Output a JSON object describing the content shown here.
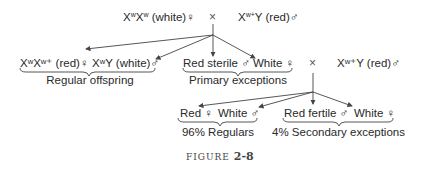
{
  "figure": {
    "label": "FIGURE",
    "number": "2-8"
  },
  "cross1": {
    "female": {
      "genotype_base": "X",
      "sup1": "w",
      "genotype_mid": "X",
      "sup2": "w",
      "phenotype": "(white)",
      "sex": "♀"
    },
    "cross_symbol": "×",
    "male": {
      "genotype_base": "X",
      "sup1": "w+",
      "genotype_end": "Y",
      "phenotype": "(red)",
      "sex": "♂"
    }
  },
  "offspring1": {
    "regular": {
      "items": [
        {
          "text": "XʷXʷ⁺ (red)♀"
        },
        {
          "text": "XʷY (white)♂"
        }
      ],
      "group_label": "Regular offspring"
    },
    "primary_exceptions": {
      "items": [
        {
          "text": "Red sterile ♂"
        },
        {
          "text": "White ♀"
        }
      ],
      "group_label": "Primary exceptions"
    }
  },
  "cross2": {
    "cross_symbol": "×",
    "male": {
      "text": "Xʷ⁺Y (red)♂"
    }
  },
  "offspring2": {
    "regulars": {
      "items": [
        {
          "text": "Red ♀"
        },
        {
          "text": "White ♂"
        }
      ],
      "group_label": "96% Regulars"
    },
    "secondary_exceptions": {
      "items": [
        {
          "text": "Red fertile ♂"
        },
        {
          "text": "White ♀"
        }
      ],
      "group_label": "4% Secondary exceptions"
    }
  },
  "colors": {
    "text": "#2a2a2a",
    "lines": "#444444"
  }
}
